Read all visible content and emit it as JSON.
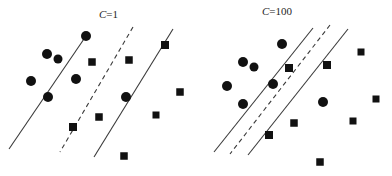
{
  "figure": {
    "title": "",
    "background_color": "#ffffff",
    "marker_color": "#111111",
    "line_color": "#3a3a3a",
    "width": 392,
    "height": 176
  },
  "panels": [
    {
      "id": "left",
      "label_prefix": "C",
      "label_suffix": "=1",
      "label_text": "C=1",
      "label_x": 99,
      "label_y": 8,
      "margin_width_px": 62,
      "lines": [
        {
          "name": "lower-margin-boundary",
          "style": "solid",
          "x1": 86,
          "y1": 36,
          "x2": 9,
          "y2": 149
        },
        {
          "name": "decision-boundary",
          "style": "dashed",
          "x1": 133,
          "y1": 27,
          "x2": 60,
          "y2": 152
        },
        {
          "name": "upper-margin-boundary",
          "style": "solid",
          "x1": 173,
          "y1": 29,
          "x2": 94,
          "y2": 157
        }
      ],
      "circles": [
        {
          "cx": 86,
          "cy": 36,
          "r": 5.0
        },
        {
          "cx": 47,
          "cy": 54,
          "r": 5.0
        },
        {
          "cx": 58,
          "cy": 59,
          "r": 4.5
        },
        {
          "cx": 31,
          "cy": 81,
          "r": 5.0
        },
        {
          "cx": 76,
          "cy": 79,
          "r": 5.0
        },
        {
          "cx": 48,
          "cy": 97,
          "r": 5.0
        },
        {
          "cx": 126,
          "cy": 97,
          "r": 5.0
        }
      ],
      "squares": [
        {
          "cx": 92,
          "cy": 62,
          "s": 7.5
        },
        {
          "cx": 129,
          "cy": 60,
          "s": 7.5
        },
        {
          "cx": 165,
          "cy": 45,
          "s": 8.0
        },
        {
          "cx": 180,
          "cy": 92,
          "s": 7.5
        },
        {
          "cx": 73,
          "cy": 127,
          "s": 8.0
        },
        {
          "cx": 99,
          "cy": 117,
          "s": 7.5
        },
        {
          "cx": 156,
          "cy": 115,
          "s": 7.0
        },
        {
          "cx": 124,
          "cy": 156,
          "s": 7.5
        }
      ]
    },
    {
      "id": "right",
      "label_prefix": "C",
      "label_suffix": "=100",
      "label_text": "C=100",
      "label_x": 262,
      "label_y": 5,
      "margin_width_px": 30,
      "lines": [
        {
          "name": "lower-margin-boundary",
          "style": "solid",
          "x1": 117,
          "y1": 28,
          "x2": 18,
          "y2": 152
        },
        {
          "name": "decision-boundary",
          "style": "dashed",
          "x1": 134,
          "y1": 25,
          "x2": 34,
          "y2": 154
        },
        {
          "name": "upper-margin-boundary",
          "style": "solid",
          "x1": 152,
          "y1": 29,
          "x2": 52,
          "y2": 155
        }
      ],
      "circles": [
        {
          "cx": 86,
          "cy": 44,
          "r": 5.0
        },
        {
          "cx": 47,
          "cy": 62,
          "r": 5.0
        },
        {
          "cx": 58,
          "cy": 67,
          "r": 4.5
        },
        {
          "cx": 31,
          "cy": 86,
          "r": 5.0
        },
        {
          "cx": 77,
          "cy": 84,
          "r": 5.0
        },
        {
          "cx": 47,
          "cy": 104,
          "r": 5.0
        },
        {
          "cx": 127,
          "cy": 102,
          "r": 5.0
        }
      ],
      "squares": [
        {
          "cx": 93,
          "cy": 68,
          "s": 8.0
        },
        {
          "cx": 131,
          "cy": 65,
          "s": 8.0
        },
        {
          "cx": 165,
          "cy": 52,
          "s": 7.0
        },
        {
          "cx": 180,
          "cy": 99,
          "s": 7.0
        },
        {
          "cx": 73,
          "cy": 135,
          "s": 8.0
        },
        {
          "cx": 98,
          "cy": 123,
          "s": 7.5
        },
        {
          "cx": 157,
          "cy": 121,
          "s": 7.0
        },
        {
          "cx": 124,
          "cy": 162,
          "s": 7.5
        }
      ]
    }
  ],
  "chart_data": {
    "type": "scatter",
    "title": "",
    "subtitle": "",
    "xlabel": "",
    "ylabel": "",
    "grid": false,
    "legend": "none",
    "axes_visible": false,
    "xlim": [
      0,
      196
    ],
    "ylim": [
      0,
      176
    ],
    "annotations": [
      {
        "text": "C=1",
        "x": 99,
        "y": 8,
        "panel": "left"
      },
      {
        "text": "C=100",
        "x": 262,
        "y": 5,
        "panel": "right"
      }
    ],
    "panels": [
      {
        "name": "C=1",
        "parameter": "C",
        "value": 1,
        "margin_width_px": 62,
        "series": [
          {
            "name": "class-circle",
            "marker": "circle",
            "color": "#111111",
            "points": [
              [
                86,
                36
              ],
              [
                47,
                54
              ],
              [
                58,
                59
              ],
              [
                31,
                81
              ],
              [
                76,
                79
              ],
              [
                48,
                97
              ],
              [
                126,
                97
              ]
            ]
          },
          {
            "name": "class-square",
            "marker": "square",
            "color": "#111111",
            "points": [
              [
                92,
                62
              ],
              [
                129,
                60
              ],
              [
                165,
                45
              ],
              [
                180,
                92
              ],
              [
                73,
                127
              ],
              [
                99,
                117
              ],
              [
                156,
                115
              ],
              [
                124,
                156
              ]
            ]
          }
        ],
        "lines": [
          {
            "name": "lower-margin-boundary",
            "style": "solid",
            "from": [
              86,
              36
            ],
            "to": [
              9,
              149
            ]
          },
          {
            "name": "decision-boundary",
            "style": "dashed",
            "from": [
              133,
              27
            ],
            "to": [
              60,
              152
            ]
          },
          {
            "name": "upper-margin-boundary",
            "style": "solid",
            "from": [
              173,
              29
            ],
            "to": [
              94,
              157
            ]
          }
        ]
      },
      {
        "name": "C=100",
        "parameter": "C",
        "value": 100,
        "margin_width_px": 30,
        "series": [
          {
            "name": "class-circle",
            "marker": "circle",
            "color": "#111111",
            "points": [
              [
                86,
                44
              ],
              [
                47,
                62
              ],
              [
                58,
                67
              ],
              [
                31,
                86
              ],
              [
                77,
                84
              ],
              [
                47,
                104
              ],
              [
                127,
                102
              ]
            ]
          },
          {
            "name": "class-square",
            "marker": "square",
            "color": "#111111",
            "points": [
              [
                93,
                68
              ],
              [
                131,
                65
              ],
              [
                165,
                52
              ],
              [
                180,
                99
              ],
              [
                73,
                135
              ],
              [
                98,
                123
              ],
              [
                157,
                121
              ],
              [
                124,
                162
              ]
            ]
          }
        ],
        "lines": [
          {
            "name": "lower-margin-boundary",
            "style": "solid",
            "from": [
              117,
              28
            ],
            "to": [
              18,
              152
            ]
          },
          {
            "name": "decision-boundary",
            "style": "dashed",
            "from": [
              134,
              25
            ],
            "to": [
              34,
              154
            ]
          },
          {
            "name": "upper-margin-boundary",
            "style": "solid",
            "from": [
              152,
              29
            ],
            "to": [
              52,
              155
            ]
          }
        ]
      }
    ]
  }
}
